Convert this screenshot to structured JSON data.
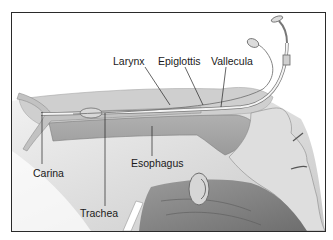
{
  "figure": {
    "labels": {
      "larynx": "Larynx",
      "epiglottis": "Epiglottis",
      "vallecula": "Vallecula",
      "carina": "Carina",
      "esophagus": "Esophagus",
      "trachea": "Trachea"
    },
    "colors": {
      "border": "#2a2a2a",
      "tissue_light": "#d9d9d9",
      "tissue_mid": "#b5b5b5",
      "tissue_dark": "#8f8f8f",
      "tube": "#efefef",
      "leader_line": "#222222",
      "text": "#1a1a1a"
    }
  }
}
